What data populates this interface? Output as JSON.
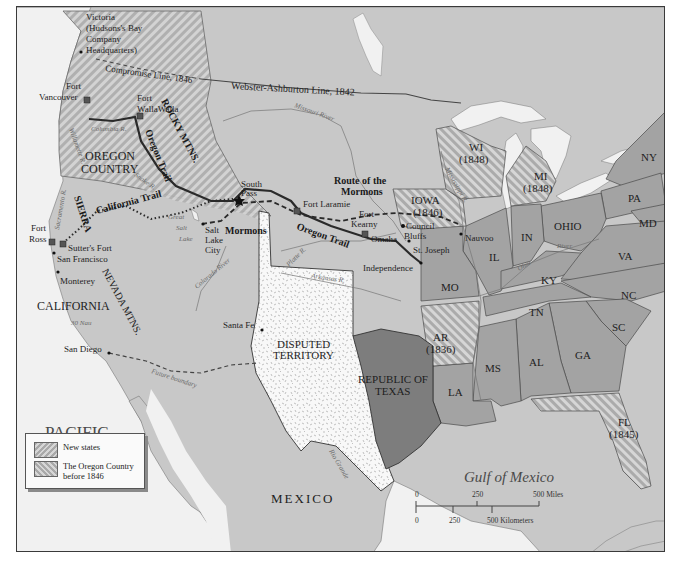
{
  "map": {
    "title_visible": false,
    "water_bodies": {
      "pacific": [
        "PACIFIC",
        "OCEAN"
      ],
      "gulf": "Gulf of Mexico"
    },
    "regions": {
      "oregon_country": [
        "OREGON",
        "COUNTRY"
      ],
      "california": "CALIFORNIA",
      "mexico": "MEXICO",
      "disputed": [
        "DISPUTED",
        "TERRITORY"
      ],
      "texas": [
        "REPUBLIC OF",
        "TEXAS"
      ]
    },
    "states": [
      {
        "abbr": "IOWA",
        "year": "(1846)",
        "new": true
      },
      {
        "abbr": "WI",
        "year": "(1848)",
        "new": true
      },
      {
        "abbr": "MI",
        "year": "(1848)",
        "new": true
      },
      {
        "abbr": "AR",
        "year": "(1836)",
        "new": true
      },
      {
        "abbr": "FL",
        "year": "(1845)",
        "new": true
      },
      {
        "abbr": "NY"
      },
      {
        "abbr": "PA"
      },
      {
        "abbr": "MD"
      },
      {
        "abbr": "OHIO"
      },
      {
        "abbr": "IN"
      },
      {
        "abbr": "IL"
      },
      {
        "abbr": "MO"
      },
      {
        "abbr": "KY"
      },
      {
        "abbr": "VA"
      },
      {
        "abbr": "NC"
      },
      {
        "abbr": "TN"
      },
      {
        "abbr": "SC"
      },
      {
        "abbr": "GA"
      },
      {
        "abbr": "AL"
      },
      {
        "abbr": "MS"
      },
      {
        "abbr": "LA"
      }
    ],
    "mountains": {
      "rocky": "ROCKY MTNS.",
      "sierra": "SIERRA",
      "nevada": "NEVADA MTNS."
    },
    "places": {
      "victoria": [
        "Victoria",
        "(Hudsons's Bay",
        "Company",
        "Headquarters)"
      ],
      "fort_vancouver": [
        "Fort",
        "Vancouver"
      ],
      "fort_walla_walla": [
        "Fort",
        "WallaWalla"
      ],
      "fort_ross": [
        "Fort",
        "Ross"
      ],
      "sutters_fort": "Sutter's Fort",
      "san_francisco": "San Francisco",
      "monterey": "Monterey",
      "san_diego": "San Diego",
      "south_pass": [
        "South",
        "Pass"
      ],
      "salt_lake_city": [
        "Salt",
        "Lake",
        "City"
      ],
      "fort_laramie": "Fort Laramie",
      "fort_kearny": [
        "Fort",
        "Kearny"
      ],
      "omaha": "Omaha",
      "council_bluffs": [
        "Council",
        "Bluffs"
      ],
      "st_joseph": "St. Joseph",
      "independence": "Independence",
      "nauvoo": "Nauvoo",
      "santa_fe": "Santa Fe"
    },
    "lines": {
      "webster": "Webster-Ashburton Line, 1842",
      "compromise": "Compromise Line, 1846",
      "oregon_trail_nw": "Oregon Trail",
      "oregon_trail": "Oregon Trail",
      "california_trail": "California Trail",
      "mormons": "Mormons",
      "route_mormons": [
        "Route of the",
        "Mormons"
      ],
      "future_boundary": "Future boundary"
    },
    "rivers": {
      "columbia": "Columbia R.",
      "willamette": "Willamette R.",
      "snake": "Snake R.",
      "sacramento": "Sacramento R.",
      "missouri": "Missouri River",
      "mississippi": "Mississippi R.",
      "platte": "Platte R.",
      "arkansas": "Arkansas R.",
      "colorado": "Colorado River",
      "rio_grande": "Rio Grande",
      "ohio": "Ohio",
      "ohio_river": "River",
      "great_salt_lake": [
        "Great",
        "Salt",
        "Lake"
      ]
    },
    "small_note": "30 Nau"
  },
  "legend": {
    "items": [
      {
        "label": "New states"
      },
      {
        "label_lines": [
          "The Oregon Country",
          "before 1846"
        ]
      }
    ]
  },
  "scale": {
    "miles": [
      "0",
      "250",
      "500 Miles"
    ],
    "km": [
      "0",
      "250",
      "500 Kilometers"
    ]
  },
  "colors": {
    "water": "#f1f1f1",
    "land": "#c8c8c8",
    "states": "#a3a3a3",
    "texas": "#7d7d7d",
    "hatch_light": "#d6d6d6",
    "hatch_dark": "#a9a9a9",
    "disputed": "#f7f7f7",
    "border": "#3a3a3a"
  }
}
